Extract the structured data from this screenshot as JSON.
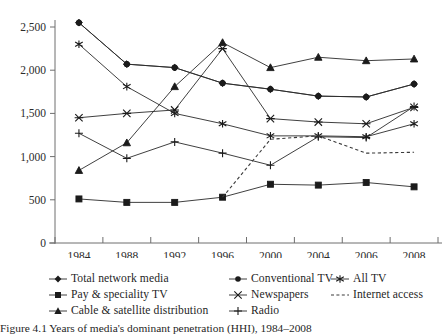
{
  "chart_data": {
    "type": "line",
    "title": "",
    "xlabel": "",
    "ylabel": "",
    "ylim": [
      0,
      2500
    ],
    "yticks": [
      0,
      500,
      1000,
      1500,
      2000,
      2500
    ],
    "ytick_labels": [
      "0",
      "500",
      "1,000",
      "1,500",
      "2,000",
      "2,500"
    ],
    "categories": [
      "1984",
      "1988",
      "1992",
      "1996",
      "2000",
      "2004",
      "2006",
      "2008"
    ],
    "x": [
      1984,
      1988,
      1992,
      1996,
      2000,
      2004,
      2006,
      2008
    ],
    "grid": false,
    "legend_position": "below-axes",
    "series": [
      {
        "name": "Total network media",
        "marker": "diamond",
        "linestyle": "solid",
        "values": [
          2550,
          2070,
          2030,
          1850,
          1780,
          1700,
          1690,
          1840
        ]
      },
      {
        "name": "Pay & speciality TV",
        "marker": "square",
        "linestyle": "solid",
        "values": [
          510,
          470,
          470,
          530,
          680,
          670,
          700,
          650
        ]
      },
      {
        "name": "Cable & satellite distribution",
        "marker": "triangle",
        "linestyle": "solid",
        "values": [
          840,
          1160,
          1810,
          2320,
          2030,
          2150,
          2110,
          2130
        ]
      },
      {
        "name": "Conventional TV",
        "marker": "circle",
        "linestyle": "solid",
        "values": [
          2550,
          2070,
          2030,
          1850,
          1780,
          1700,
          1690,
          1840
        ]
      },
      {
        "name": "Newspapers",
        "marker": "x-star",
        "linestyle": "solid",
        "values": [
          1450,
          1500,
          1540,
          2250,
          1440,
          1400,
          1380,
          1570
        ]
      },
      {
        "name": "Radio",
        "marker": "plus",
        "linestyle": "solid",
        "values": [
          1270,
          980,
          1170,
          1040,
          900,
          1230,
          1220,
          1580
        ]
      },
      {
        "name": "All TV",
        "marker": "asterisk",
        "linestyle": "solid",
        "values": [
          2300,
          1810,
          1500,
          1380,
          1240,
          1240,
          1230,
          1380
        ]
      },
      {
        "name": "Internet access",
        "marker": "none",
        "linestyle": "dashed",
        "values": [
          null,
          null,
          null,
          530,
          1200,
          1240,
          1040,
          1050
        ]
      }
    ]
  },
  "legend": {
    "items": [
      {
        "label": "Total network media",
        "marker": "diamond",
        "style": "solid",
        "row": 0,
        "col": 0
      },
      {
        "label": "Conventional TV",
        "marker": "circle",
        "style": "solid",
        "row": 0,
        "col": 1
      },
      {
        "label": "All TV",
        "marker": "asterisk",
        "style": "solid",
        "row": 0,
        "col": 2
      },
      {
        "label": "Pay & speciality TV",
        "marker": "square",
        "style": "solid",
        "row": 1,
        "col": 0
      },
      {
        "label": "Newspapers",
        "marker": "x-star",
        "style": "solid",
        "row": 1,
        "col": 1
      },
      {
        "label": "Internet access",
        "marker": "none",
        "style": "dashed",
        "row": 1,
        "col": 2
      },
      {
        "label": "Cable & satellite distribution",
        "marker": "triangle",
        "style": "solid",
        "row": 2,
        "col": 0
      },
      {
        "label": "Radio",
        "marker": "plus",
        "style": "solid",
        "row": 2,
        "col": 1
      }
    ]
  },
  "caption": {
    "text": "Figure 4.1  Years of media's dominant penetration (HHI), 1984–2008"
  }
}
